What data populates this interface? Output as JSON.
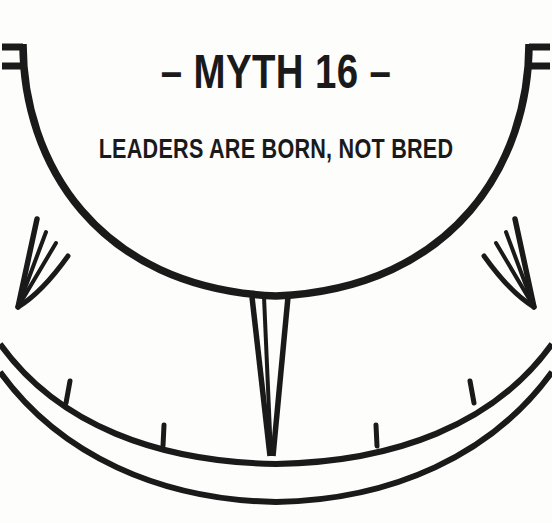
{
  "page": {
    "background_color": "#fdfdfc",
    "ink_color": "#1a1a1a"
  },
  "heading": {
    "title": "– MYTH 16 –",
    "subtitle": "LEADERS ARE BORN, NOT BRED"
  },
  "illustration": {
    "name": "ship-wheel-diagram",
    "description": "Line drawing of a large wheel rim with spokes and a graduated outer band",
    "stroke_color": "#1a1a1a",
    "parts": [
      "bowl-arc",
      "left-tab",
      "right-tab",
      "left-spike",
      "center-spike",
      "right-spike",
      "outer-arc",
      "inner-arc",
      "tick-marks"
    ],
    "tick_count": 4
  }
}
